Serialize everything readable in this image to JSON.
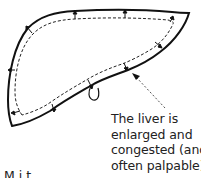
{
  "figure": {
    "subject": "liver",
    "caption_lines": [
      "The liver is",
      "enlarged and",
      "congested (and",
      "often palpable)"
    ],
    "cutoff_text": "M    i    t",
    "colors": {
      "outline": "#111111",
      "dashed": "#222222",
      "arrow": "#555555",
      "text": "#222222"
    },
    "elements": {
      "outer_outline": "solid liver outline (enlarged)",
      "inner_outline": "dashed normal liver outline",
      "expansion_arrows": 10,
      "gallbladder": "small loop at inferior border",
      "pointer_arrow": "dashed arrow pointing to inferior border"
    }
  }
}
